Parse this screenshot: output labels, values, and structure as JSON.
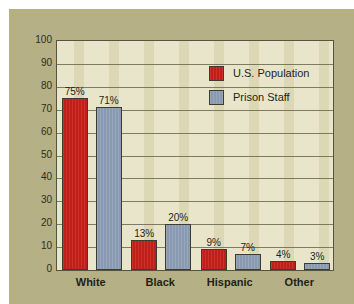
{
  "chart_data": {
    "type": "bar",
    "title": "",
    "subtitle": "",
    "xlabel": "",
    "ylabel": "",
    "categories": [
      "White",
      "Black",
      "Hispanic",
      "Other"
    ],
    "series": [
      {
        "name": "U.S. Population",
        "color": "#c8211a",
        "values": [
          75,
          13,
          9,
          4
        ],
        "labels": [
          "75%",
          "13%",
          "9%",
          "4%"
        ]
      },
      {
        "name": "Prison Staff",
        "color": "#8fa0b7",
        "values": [
          71,
          20,
          7,
          3
        ],
        "labels": [
          "71%",
          "20%",
          "7%",
          "3%"
        ]
      }
    ],
    "ylim": [
      0,
      100
    ],
    "ytick_step": 10,
    "yticks": [
      "100",
      "90",
      "80",
      "70",
      "60",
      "50",
      "40",
      "30",
      "20",
      "10",
      "0"
    ],
    "grid": true,
    "legend_position": "upper-right-inside"
  },
  "legend": {
    "entries": [
      {
        "label": "U.S. Population"
      },
      {
        "label": "Prison Staff"
      }
    ]
  },
  "colors": {
    "page_background": "#ffffff",
    "paper_background": "#b6b185",
    "plot_background": "#e9e5cb",
    "plot_band": "#dcd7b4",
    "axis_line": "#55543d",
    "gridline": "#6b6a4e",
    "text": "#1f1f18",
    "series_population": "#c8211a",
    "series_staff": "#8fa0b7"
  }
}
